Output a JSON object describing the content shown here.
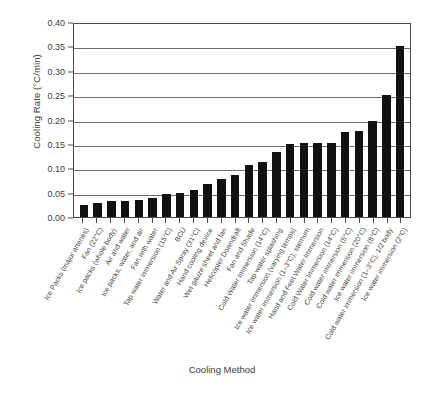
{
  "chart_data": {
    "type": "bar",
    "title": "",
    "xlabel": "Cooling Method",
    "ylabel": "Cooling Rate (°C/min)",
    "ylim": [
      0,
      0.4
    ],
    "ytick_labels": [
      "0.40",
      "0.35",
      "0.30",
      "0.25",
      "0.20",
      "0.15",
      "0.10",
      "0.05",
      "0.00"
    ],
    "ytick_values": [
      0.4,
      0.35,
      0.3,
      0.25,
      0.2,
      0.15,
      0.1,
      0.05,
      0.0
    ],
    "grid": true,
    "legend": "none",
    "bar_color": "#111111",
    "categories": [
      "Ice Packs (major arteries)",
      "Fan (22°C)",
      "Ice packs (whole body)",
      "Air and water",
      "Ice packs, water, and air",
      "Fan with water",
      "Tap water immersion (15°C)",
      "BCU",
      "Water and Air Spray (31°C)",
      "Hand cooling device",
      "Wet gauze sheet and fan",
      "Helicopter Downdraft",
      "Fan and Shade",
      "Cold Water Immersion (14°C)",
      "Tap water splashing",
      "Ice water immersion (varying temps)",
      "Ice water immersion (1–3°C), sternum",
      "Hand and Feet Water Immersion",
      "Cold Water Immersion (14°C)",
      "Cold water immersion (5°C)",
      "Cold water immersion (20°C)",
      "Ice water immersion (8°C)",
      "Cold water immersion (1–3°C), 1/2 body",
      "Ice water immersion (2°C)"
    ],
    "values": [
      0.025,
      0.028,
      0.033,
      0.033,
      0.034,
      0.04,
      0.048,
      0.049,
      0.055,
      0.067,
      0.078,
      0.086,
      0.107,
      0.112,
      0.133,
      0.15,
      0.152,
      0.152,
      0.152,
      0.175,
      0.177,
      0.196,
      0.25,
      0.35
    ]
  }
}
